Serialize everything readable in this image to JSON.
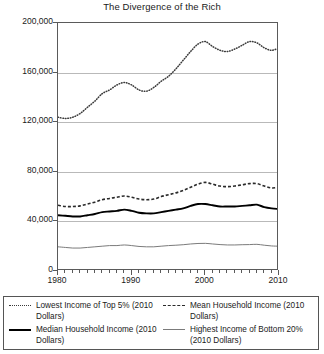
{
  "chart_data": {
    "type": "line",
    "title": "The Divergence of the Rich",
    "xlabel": "",
    "ylabel": "",
    "xlim": [
      1980,
      2010
    ],
    "ylim": [
      0,
      200000
    ],
    "grid": true,
    "legend_position": "bottom",
    "ytick_labels": [
      "0",
      "40,000",
      "80,000",
      "120,000",
      "160,000",
      "200,000"
    ],
    "ytick_values": [
      0,
      40000,
      80000,
      120000,
      160000,
      200000
    ],
    "xtick_labels": [
      "1980",
      "1990",
      "2000",
      "2010"
    ],
    "xtick_values": [
      1980,
      1990,
      2000,
      2010
    ],
    "x": [
      1980,
      1981,
      1982,
      1983,
      1984,
      1985,
      1986,
      1987,
      1988,
      1989,
      1990,
      1991,
      1992,
      1993,
      1994,
      1995,
      1996,
      1997,
      1998,
      1999,
      2000,
      2001,
      2002,
      2003,
      2004,
      2005,
      2006,
      2007,
      2008,
      2009,
      2010
    ],
    "series": [
      {
        "name": "Lowest Income of Top 5% (2010 Dollars)",
        "style": "dotted",
        "color": "#3a3a3a",
        "values": [
          124000,
          123000,
          124000,
          127000,
          132000,
          137000,
          143000,
          146000,
          150000,
          152000,
          150000,
          146000,
          145000,
          148000,
          153000,
          157000,
          163000,
          170000,
          177000,
          183000,
          185000,
          181000,
          178000,
          177000,
          179000,
          182000,
          185000,
          184000,
          180000,
          178000,
          180000
        ]
      },
      {
        "name": "Mean Household Income (2010 Dollars)",
        "style": "dashed",
        "color": "#2a2a2a",
        "values": [
          53000,
          52000,
          52000,
          52500,
          54000,
          55500,
          57500,
          58500,
          59500,
          60500,
          59500,
          58000,
          57500,
          58000,
          60000,
          61500,
          63000,
          65000,
          67500,
          70000,
          71500,
          70000,
          68500,
          68000,
          68500,
          69500,
          70500,
          70500,
          68500,
          67000,
          67500
        ]
      },
      {
        "name": "Median Household Income (2010 Dollars)",
        "style": "solid-thick",
        "color": "#000000",
        "values": [
          45000,
          44500,
          44000,
          44000,
          45000,
          46000,
          47500,
          48000,
          48500,
          49500,
          48500,
          47000,
          46500,
          46500,
          47500,
          48500,
          49500,
          50500,
          52500,
          54000,
          54000,
          53000,
          52000,
          52000,
          52000,
          52500,
          53000,
          53500,
          51500,
          50500,
          50000
        ]
      },
      {
        "name": "Highest Income of Bottom 20% (2010 Dollars)",
        "style": "solid-thin",
        "color": "#7b7b7b",
        "values": [
          19500,
          19000,
          18500,
          18500,
          19000,
          19500,
          20000,
          20500,
          20500,
          21000,
          20500,
          19800,
          19500,
          19500,
          20000,
          20500,
          20800,
          21200,
          21800,
          22200,
          22300,
          21800,
          21300,
          21000,
          21000,
          21200,
          21300,
          21500,
          20800,
          20200,
          20000
        ]
      }
    ]
  },
  "legend": {
    "items": [
      {
        "label": "Lowest Income of Top 5% (2010 Dollars)",
        "style": "dotted"
      },
      {
        "label": "Mean Household Income (2010 Dollars)",
        "style": "dashed"
      },
      {
        "label": "Median Household Income (2010 Dollars)",
        "style": "solid-thick"
      },
      {
        "label": "Highest Income of Bottom 20% (2010 Dollars)",
        "style": "solid-thin"
      }
    ]
  }
}
